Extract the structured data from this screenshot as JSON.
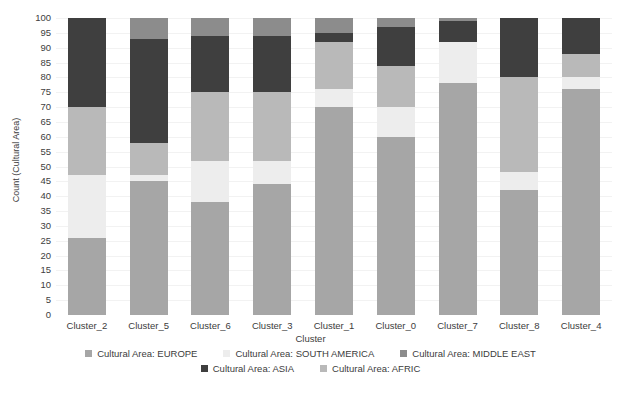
{
  "chart_data": {
    "type": "bar",
    "stacked": true,
    "title": "",
    "xlabel": "Cluster",
    "ylabel": "Count (Cultural Area)",
    "ylim": [
      0,
      100
    ],
    "ytick_step": 5,
    "yticks": [
      0,
      5,
      10,
      15,
      20,
      25,
      30,
      35,
      40,
      45,
      50,
      55,
      60,
      65,
      70,
      75,
      80,
      85,
      90,
      95,
      100
    ],
    "grid": true,
    "legend_position": "bottom",
    "categories": [
      "Cluster_2",
      "Cluster_5",
      "Cluster_6",
      "Cluster_3",
      "Cluster_1",
      "Cluster_0",
      "Cluster_7",
      "Cluster_8",
      "Cluster_4"
    ],
    "series": [
      {
        "name": "Cultural Area: EUROPE",
        "color": "#a6a6a6",
        "values": [
          26,
          45,
          38,
          44,
          70,
          60,
          78,
          42,
          76
        ]
      },
      {
        "name": "Cultural Area: SOUTH AMERICA",
        "color": "#ededed",
        "values": [
          21,
          2,
          14,
          8,
          6,
          10,
          14,
          6,
          4
        ]
      },
      {
        "name": "Cultural Area: AFRIC",
        "color": "#b9b9b9",
        "values": [
          23,
          11,
          23,
          23,
          16,
          14,
          0,
          32,
          8
        ]
      },
      {
        "name": "Cultural Area: ASIA",
        "color": "#3f3f3f",
        "values": [
          30,
          35,
          19,
          19,
          3,
          13,
          7,
          20,
          12
        ]
      },
      {
        "name": "Cultural Area: MIDDLE EAST",
        "color": "#8c8c8c",
        "values": [
          0,
          7,
          6,
          6,
          5,
          3,
          1,
          0,
          0
        ]
      }
    ],
    "stack_order": [
      "Cultural Area: EUROPE",
      "Cultural Area: SOUTH AMERICA",
      "Cultural Area: AFRIC",
      "Cultural Area: ASIA",
      "Cultural Area: MIDDLE EAST"
    ],
    "legend_rows": [
      [
        "Cultural Area: EUROPE",
        "Cultural Area: SOUTH AMERICA",
        "Cultural Area: MIDDLE EAST"
      ],
      [
        "Cultural Area: ASIA",
        "Cultural Area: AFRIC"
      ]
    ]
  },
  "colors": {
    "europe": "#a6a6a6",
    "south_america": "#ededed",
    "middle_east": "#8c8c8c",
    "asia": "#3f3f3f",
    "afric": "#b9b9b9",
    "grid": "#f2f2f2",
    "text": "#3c3c3c",
    "background": "#ffffff"
  }
}
